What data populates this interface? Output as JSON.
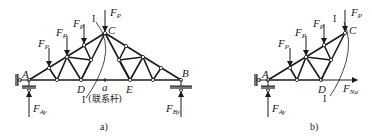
{
  "figure_a": {
    "caption": "a)",
    "nodes": {
      "A": "A",
      "B": "B",
      "C": "C",
      "D": "D",
      "E": "E",
      "a": "a"
    },
    "section_label": "I",
    "tie_rod_label": "(联系杆)",
    "loads": {
      "F": "F",
      "P": "P"
    },
    "reactions": {
      "left": {
        "F": "F",
        "sub": "Ay"
      },
      "right": {
        "F": "F",
        "sub": "By"
      }
    }
  },
  "figure_b": {
    "caption": "b)",
    "nodes": {
      "A": "A",
      "C": "C",
      "D": "D"
    },
    "section_label": "I",
    "loads": {
      "F": "F",
      "P": "P"
    },
    "reactions": {
      "left": {
        "F": "F",
        "sub": "Ay"
      }
    },
    "internal_force": {
      "F": "F",
      "sub": "Na"
    }
  },
  "colors": {
    "line": "#1a1a1a",
    "hatch": "#777777"
  }
}
